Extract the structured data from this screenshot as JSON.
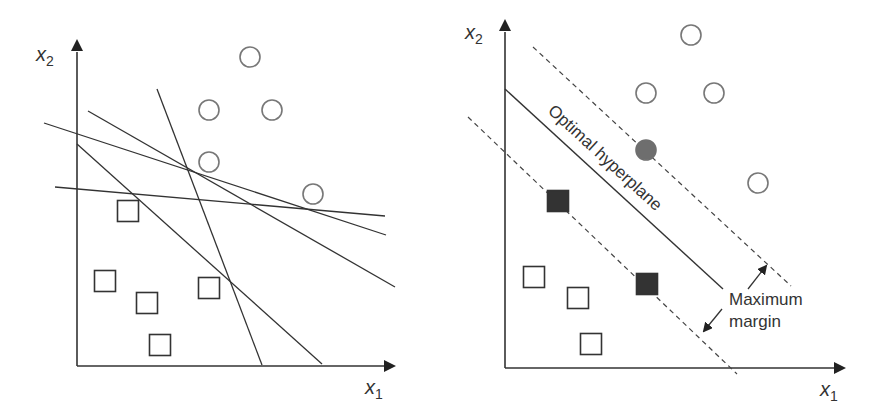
{
  "colors": {
    "stroke": "#333333",
    "circle_stroke": "#777777",
    "support_circle_fill": "#6e6e6e",
    "support_square_fill": "#333333",
    "background": "#ffffff"
  },
  "left_panel": {
    "x_axis_label": "x",
    "x_axis_sub": "1",
    "y_axis_label": "x",
    "y_axis_sub": "2",
    "circles": [
      [
        250,
        57
      ],
      [
        209,
        110
      ],
      [
        272,
        110
      ],
      [
        209,
        162
      ],
      [
        313,
        194
      ]
    ],
    "squares": [
      [
        128,
        211
      ],
      [
        105,
        281
      ],
      [
        147,
        303
      ],
      [
        209,
        288
      ],
      [
        160,
        345
      ]
    ],
    "separating_lines": [
      [
        [
          157,
          89
        ],
        [
          262,
          365
        ]
      ],
      [
        [
          88,
          111
        ],
        [
          395,
          287
        ]
      ],
      [
        [
          44,
          123
        ],
        [
          386,
          235
        ]
      ],
      [
        [
          77,
          144
        ],
        [
          322,
          364
        ]
      ],
      [
        [
          55,
          187
        ],
        [
          385,
          216
        ]
      ]
    ]
  },
  "right_panel": {
    "x_axis_label": "x",
    "x_axis_sub": "1",
    "y_axis_label": "x",
    "y_axis_sub": "2",
    "hyperplane_label": "Optimal hyperplane",
    "margin_label_line1": "Maximum",
    "margin_label_line2": "margin",
    "circles": [
      [
        691,
        35
      ],
      [
        646,
        93
      ],
      [
        714,
        93
      ],
      [
        758,
        183
      ]
    ],
    "support_circles": [
      [
        646,
        150
      ]
    ],
    "squares": [
      [
        534,
        277
      ],
      [
        578,
        298
      ],
      [
        591,
        344
      ]
    ],
    "support_squares": [
      [
        558,
        201
      ],
      [
        647,
        284
      ]
    ],
    "hyperplane": [
      [
        505,
        89
      ],
      [
        723,
        289
      ]
    ],
    "upper_margin": [
      [
        533,
        47
      ],
      [
        791,
        286
      ]
    ],
    "lower_margin": [
      [
        468,
        117
      ],
      [
        737,
        374
      ]
    ]
  }
}
